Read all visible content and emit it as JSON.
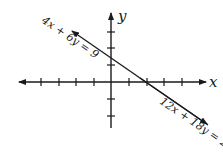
{
  "diagram": {
    "type": "coordinate-plane-graph",
    "axes": {
      "x_label": "x",
      "y_label": "y",
      "x_ticks_left": 4,
      "x_ticks_right": 4,
      "y_ticks_up": 3,
      "y_ticks_down": 2
    },
    "lines": [
      {
        "equation": "4x + 6y = 9"
      },
      {
        "equation": "12x + 18y = 27"
      }
    ],
    "colors": {
      "ink": "#1a1a1a",
      "background": "#ffffff"
    }
  }
}
